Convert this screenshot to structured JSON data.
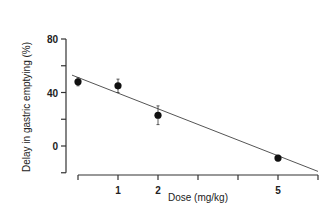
{
  "chart_data": {
    "type": "scatter",
    "title": "",
    "xlabel": "Dose (mg/kg)",
    "ylabel": "Delay in gastric emptying (%)",
    "x_tick_positions": [
      0,
      1,
      2,
      3,
      4,
      5,
      6
    ],
    "x_tick_labels": [
      "",
      "1",
      "2",
      "",
      "",
      "5",
      ""
    ],
    "y_ticks": [
      -20,
      0,
      20,
      40,
      60,
      80
    ],
    "y_tick_labels": [
      "",
      "0",
      "",
      "40",
      "",
      "80"
    ],
    "ylim": [
      -20,
      80
    ],
    "xlim": [
      0,
      6
    ],
    "grid": false,
    "series": [
      {
        "name": "Delay",
        "marker": "filled-circle",
        "points": [
          {
            "x": 0,
            "y": 48,
            "err": 3
          },
          {
            "x": 1,
            "y": 45,
            "err": 5
          },
          {
            "x": 2,
            "y": 23,
            "err": 7
          },
          {
            "x": 5,
            "y": -9,
            "err": 2
          }
        ]
      }
    ],
    "fit_line": {
      "x1": -0.15,
      "y1": 53,
      "x2": 6.0,
      "y2": -19
    }
  }
}
